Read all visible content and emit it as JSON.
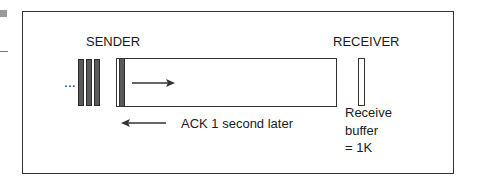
{
  "diagram": {
    "sender": {
      "label": "SENDER",
      "queued_indicator": "...",
      "queued_packets": 3
    },
    "receiver": {
      "label": "RECEIVER",
      "buffer_caption_lines": [
        "Receive",
        "buffer",
        "= 1K"
      ]
    },
    "data_arrow": {
      "direction": "right"
    },
    "ack": {
      "label": "ACK 1 second later",
      "direction": "left"
    },
    "colors": {
      "stroke": "#333333",
      "packet_fill": "#5a5a5a",
      "background": "#ffffff"
    }
  }
}
